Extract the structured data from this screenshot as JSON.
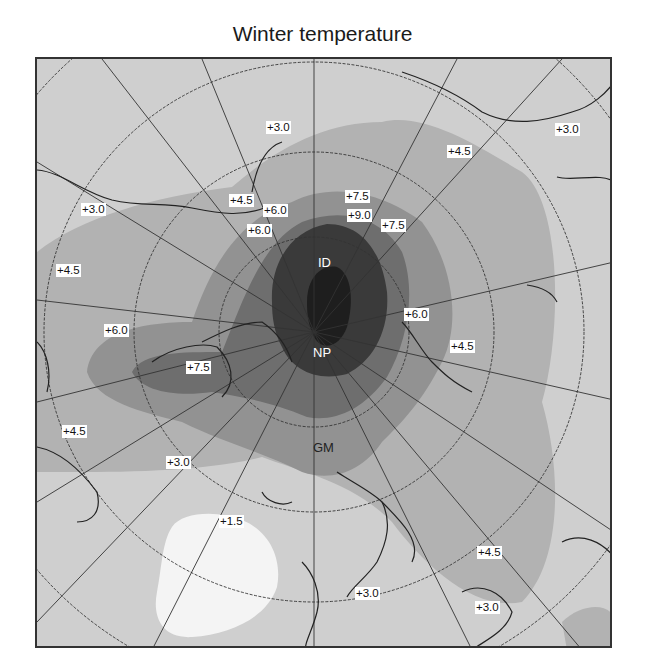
{
  "title": "Winter temperature",
  "map": {
    "projection": "north-polar-stereographic",
    "markers": [
      {
        "id": "ID",
        "label": "ID",
        "x": 318,
        "y": 262
      },
      {
        "id": "NP",
        "label": "NP",
        "x": 313,
        "y": 352
      },
      {
        "id": "GM",
        "label": "GM",
        "x": 313,
        "y": 447
      }
    ],
    "contour_labels": [
      {
        "text": "+3.0",
        "x": 266,
        "y": 126
      },
      {
        "text": "+3.0",
        "x": 555,
        "y": 128
      },
      {
        "text": "+4.5",
        "x": 447,
        "y": 150
      },
      {
        "text": "+4.5",
        "x": 229,
        "y": 199
      },
      {
        "text": "+7.5",
        "x": 345,
        "y": 195
      },
      {
        "text": "+3.0",
        "x": 81,
        "y": 208
      },
      {
        "text": "+6.0",
        "x": 263,
        "y": 209
      },
      {
        "text": "+9.0",
        "x": 347,
        "y": 214
      },
      {
        "text": "+7.5",
        "x": 381,
        "y": 224
      },
      {
        "text": "+6.0",
        "x": 247,
        "y": 229
      },
      {
        "text": "+4.5",
        "x": 56,
        "y": 269
      },
      {
        "text": "+6.0",
        "x": 404,
        "y": 313
      },
      {
        "text": "+6.0",
        "x": 104,
        "y": 329
      },
      {
        "text": "+4.5",
        "x": 450,
        "y": 345
      },
      {
        "text": "+7.5",
        "x": 186,
        "y": 366
      },
      {
        "text": "+4.5",
        "x": 62,
        "y": 430
      },
      {
        "text": "+3.0",
        "x": 166,
        "y": 461
      },
      {
        "text": "+1.5",
        "x": 219,
        "y": 520
      },
      {
        "text": "+4.5",
        "x": 477,
        "y": 551
      },
      {
        "text": "+3.0",
        "x": 355,
        "y": 592
      },
      {
        "text": "+3.0",
        "x": 475,
        "y": 606
      }
    ],
    "legend_scale": [
      "+1.5",
      "+3.0",
      "+4.5",
      "+6.0",
      "+7.5",
      "+9.0"
    ],
    "colors": {
      "level_1_5": "#f4f4f4",
      "level_3_0": "#cfcfcf",
      "level_4_5": "#b2b2b2",
      "level_6_0": "#929292",
      "level_7_5": "#6e6e6e",
      "level_9_0": "#3a3a3a",
      "core": "#1e1e1e",
      "grid": "#333333",
      "coast": "#222222"
    }
  }
}
